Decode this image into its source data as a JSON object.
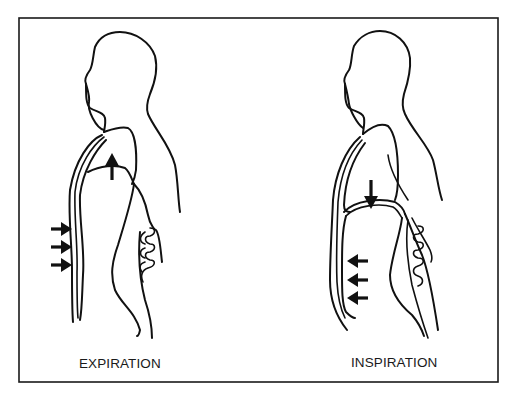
{
  "diagram": {
    "panels": [
      {
        "id": "expiration",
        "label": "EXPIRATION",
        "diaphragm_arrow": "up",
        "chest_arrows": {
          "count": 3,
          "direction": "right"
        }
      },
      {
        "id": "inspiration",
        "label": "INSPIRATION",
        "diaphragm_arrow": "down",
        "chest_arrows": {
          "count": 3,
          "direction": "left"
        }
      }
    ],
    "icons": {
      "arrow_up": "arrow-up-icon",
      "arrow_down": "arrow-down-icon",
      "arrow_right": "arrow-right-icon",
      "arrow_left": "arrow-left-icon"
    },
    "colors": {
      "line": "#111111",
      "background": "#ffffff"
    }
  }
}
